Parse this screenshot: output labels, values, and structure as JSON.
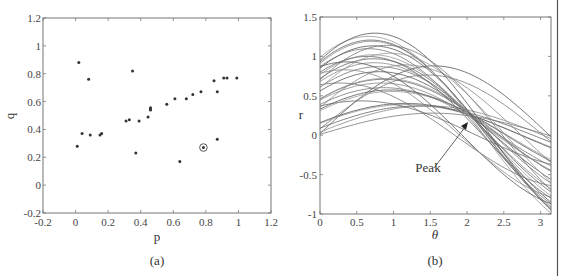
{
  "chart_data": [
    {
      "type": "scatter",
      "caption": "(a)",
      "xlabel": "p",
      "ylabel": "q",
      "xlim": [
        -0.2,
        1.2
      ],
      "ylim": [
        -0.2,
        1.2
      ],
      "xticks": [
        "-0.2",
        "0",
        "0.2",
        "0.4",
        "0.6",
        "0.8",
        "1",
        "1.2"
      ],
      "yticks": [
        "-0.2",
        "0",
        "0.2",
        "0.4",
        "0.6",
        "0.8",
        "1",
        "1.2"
      ],
      "grid": false,
      "points": [
        [
          0.02,
          0.88
        ],
        [
          0.08,
          0.76
        ],
        [
          0.04,
          0.37
        ],
        [
          0.09,
          0.36
        ],
        [
          0.15,
          0.36
        ],
        [
          0.16,
          0.37
        ],
        [
          0.01,
          0.28
        ],
        [
          0.35,
          0.82
        ],
        [
          0.37,
          0.23
        ],
        [
          0.31,
          0.46
        ],
        [
          0.33,
          0.47
        ],
        [
          0.39,
          0.46
        ],
        [
          0.445,
          0.49
        ],
        [
          0.46,
          0.54
        ],
        [
          0.46,
          0.555
        ],
        [
          0.46,
          0.545
        ],
        [
          0.56,
          0.58
        ],
        [
          0.61,
          0.62
        ],
        [
          0.68,
          0.62
        ],
        [
          0.72,
          0.65
        ],
        [
          0.77,
          0.67
        ],
        [
          0.85,
          0.75
        ],
        [
          0.87,
          0.67
        ],
        [
          0.91,
          0.77
        ],
        [
          0.93,
          0.77
        ],
        [
          0.99,
          0.77
        ],
        [
          0.87,
          0.33
        ],
        [
          0.64,
          0.17
        ]
      ],
      "highlighted_point": [
        0.785,
        0.27
      ]
    },
    {
      "type": "line",
      "caption": "(b)",
      "xlabel": "θ",
      "ylabel": "r",
      "xlim": [
        0,
        3.1416
      ],
      "ylim": [
        -1,
        1.5
      ],
      "xticks": [
        "0",
        "0.5",
        "1",
        "1.5",
        "2",
        "2.5",
        "3"
      ],
      "yticks": [
        "-1",
        "-0.5",
        "0",
        "0.5",
        "1",
        "1.5"
      ],
      "grid": false,
      "annotation": {
        "text": "Peak",
        "arrow_to": [
          2.0,
          0.27
        ]
      },
      "series_description": "Family of sinusoids r = p·cos(θ) + q·sin(θ), one per point in (a), all crossing near θ≈2, r≈0.27",
      "series": [
        {
          "p": 0.02,
          "q": 0.88
        },
        {
          "p": 0.08,
          "q": 0.76
        },
        {
          "p": 0.04,
          "q": 0.37
        },
        {
          "p": 0.09,
          "q": 0.36
        },
        {
          "p": 0.15,
          "q": 0.36
        },
        {
          "p": 0.16,
          "q": 0.37
        },
        {
          "p": 0.01,
          "q": 0.28
        },
        {
          "p": 0.35,
          "q": 0.82
        },
        {
          "p": 0.37,
          "q": 0.23
        },
        {
          "p": 0.31,
          "q": 0.46
        },
        {
          "p": 0.33,
          "q": 0.47
        },
        {
          "p": 0.39,
          "q": 0.46
        },
        {
          "p": 0.445,
          "q": 0.49
        },
        {
          "p": 0.46,
          "q": 0.54
        },
        {
          "p": 0.46,
          "q": 0.555
        },
        {
          "p": 0.56,
          "q": 0.58
        },
        {
          "p": 0.61,
          "q": 0.62
        },
        {
          "p": 0.68,
          "q": 0.62
        },
        {
          "p": 0.72,
          "q": 0.65
        },
        {
          "p": 0.77,
          "q": 0.67
        },
        {
          "p": 0.85,
          "q": 0.75
        },
        {
          "p": 0.87,
          "q": 0.67
        },
        {
          "p": 0.91,
          "q": 0.77
        },
        {
          "p": 0.93,
          "q": 0.77
        },
        {
          "p": 0.99,
          "q": 0.77
        },
        {
          "p": 0.87,
          "q": 0.33
        },
        {
          "p": 0.64,
          "q": 0.17
        },
        {
          "p": 0.785,
          "q": 0.27
        },
        {
          "p": 0.8,
          "q": 0.6
        },
        {
          "p": 0.6,
          "q": 0.85
        },
        {
          "p": 0.95,
          "q": 0.88
        },
        {
          "p": 0.7,
          "q": 0.9
        }
      ]
    }
  ],
  "figure": {
    "panel_a": {
      "caption": "(a)",
      "xlabel": "p",
      "ylabel": "q"
    },
    "panel_b": {
      "caption": "(b)",
      "xlabel": "θ",
      "ylabel": "r",
      "annotation": "Peak"
    }
  }
}
